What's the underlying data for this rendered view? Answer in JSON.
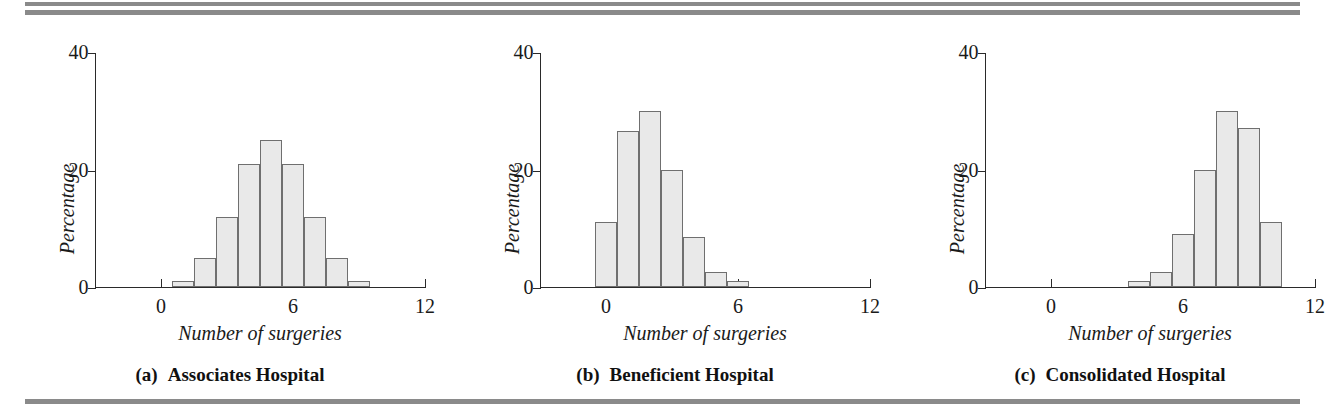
{
  "figure": {
    "rules_color": "#8a8a8a",
    "bar_fill": "#e9e9e9",
    "bar_stroke": "#6f6f6f"
  },
  "panels": [
    {
      "tag": "(a)",
      "caption": "Associates Hospital",
      "xlabel": "Number of surgeries",
      "ylabel": "Percentage",
      "yticks": [
        "0",
        "20",
        "40"
      ],
      "xticks": [
        "0",
        "6",
        "12"
      ]
    },
    {
      "tag": "(b)",
      "caption": "Beneficient Hospital",
      "xlabel": "Number of surgeries",
      "ylabel": "Percentage",
      "yticks": [
        "0",
        "20",
        "40"
      ],
      "xticks": [
        "0",
        "6",
        "12"
      ]
    },
    {
      "tag": "(c)",
      "caption": "Consolidated Hospital",
      "xlabel": "Number of surgeries",
      "ylabel": "Percentage",
      "yticks": [
        "0",
        "20",
        "40"
      ],
      "xticks": [
        "0",
        "6",
        "12"
      ]
    }
  ],
  "chart_data": [
    {
      "type": "bar",
      "title": "(a)  Associates Hospital",
      "xlabel": "Number of surgeries",
      "ylabel": "Percentage",
      "xlim": [
        -3,
        12
      ],
      "ylim": [
        0,
        40
      ],
      "yticks": [
        0,
        20,
        40
      ],
      "xticks": [
        0,
        6,
        12
      ],
      "grid": false,
      "legend": null,
      "bin_width": 1,
      "bin_starts": [
        0.5,
        1.5,
        2.5,
        3.5,
        4.5,
        5.5,
        6.5,
        7.5,
        8.5
      ],
      "categories": [
        "0.5-1.5",
        "1.5-2.5",
        "2.5-3.5",
        "3.5-4.5",
        "4.5-5.5",
        "5.5-6.5",
        "6.5-7.5",
        "7.5-8.5",
        "8.5-9.5"
      ],
      "values": [
        1,
        5,
        12,
        21,
        25,
        21,
        12,
        5,
        1
      ]
    },
    {
      "type": "bar",
      "title": "(b)  Beneficient Hospital",
      "xlabel": "Number of surgeries",
      "ylabel": "Percentage",
      "xlim": [
        -3,
        12
      ],
      "ylim": [
        0,
        40
      ],
      "yticks": [
        0,
        20,
        40
      ],
      "xticks": [
        0,
        6,
        12
      ],
      "grid": false,
      "legend": null,
      "bin_width": 1,
      "bin_starts": [
        -0.5,
        0.5,
        1.5,
        2.5,
        3.5,
        4.5,
        5.5
      ],
      "categories": [
        "-0.5-0.5",
        "0.5-1.5",
        "1.5-2.5",
        "2.5-3.5",
        "3.5-4.5",
        "4.5-5.5",
        "5.5-6.5"
      ],
      "values": [
        11,
        26.5,
        30,
        20,
        8.5,
        2.5,
        1
      ]
    },
    {
      "type": "bar",
      "title": "(c)  Consolidated Hospital",
      "xlabel": "Number of surgeries",
      "ylabel": "Percentage",
      "xlim": [
        -3,
        12
      ],
      "ylim": [
        0,
        40
      ],
      "yticks": [
        0,
        20,
        40
      ],
      "xticks": [
        0,
        6,
        12
      ],
      "grid": false,
      "legend": null,
      "bin_width": 1,
      "bin_starts": [
        3.5,
        4.5,
        5.5,
        6.5,
        7.5,
        8.5,
        9.5
      ],
      "categories": [
        "3.5-4.5",
        "4.5-5.5",
        "5.5-6.5",
        "6.5-7.5",
        "7.5-8.5",
        "8.5-9.5",
        "9.5-10.5"
      ],
      "values": [
        1,
        2.5,
        9,
        20,
        30,
        27,
        11
      ]
    }
  ]
}
